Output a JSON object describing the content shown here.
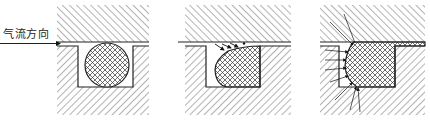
{
  "diagram": {
    "type": "seal-cross-section-sequence",
    "label_airflow": "气流方向",
    "panels": [
      {
        "id": "panel-1",
        "state": "o-ring seated, round"
      },
      {
        "id": "panel-2",
        "state": "o-ring deformed, flow pushing at top edge"
      },
      {
        "id": "panel-3",
        "state": "o-ring pressed into gap, pressure arrows on left face"
      }
    ],
    "colors": {
      "line": "#222222",
      "hatch": "#555555",
      "background": "#ffffff"
    }
  }
}
